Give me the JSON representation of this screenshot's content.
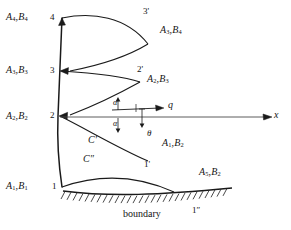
{
  "figure": {
    "title": "boundary",
    "caption": "boundary",
    "axis": {
      "x_label": "x",
      "velocity_label": "q",
      "angle_theta": "θ",
      "angle_alpha_upper": "α",
      "angle_alpha_lower": "α"
    },
    "nodes": [
      {
        "id": "node-4",
        "point_label": "4",
        "riemann_label": "A₄,B₄",
        "A": "A",
        "Asub": "4",
        "B": "B",
        "Bsub": "4"
      },
      {
        "id": "node-3",
        "point_label": "3",
        "riemann_label": "A₃,B₃",
        "A": "A",
        "Asub": "3",
        "B": "B",
        "Bsub": "3"
      },
      {
        "id": "node-2",
        "point_label": "2",
        "riemann_label": "A₂,B₂",
        "A": "A",
        "Asub": "2",
        "B": "B",
        "Bsub": "2"
      },
      {
        "id": "node-1",
        "point_label": "1",
        "riemann_label": "A₁,B₁",
        "A": "A",
        "Asub": "1",
        "B": "B",
        "Bsub": "1"
      }
    ],
    "primed_points": [
      {
        "id": "node-3-prime",
        "label": "3'"
      },
      {
        "id": "node-2-prime",
        "label": "2'"
      },
      {
        "id": "node-1-prime",
        "label": "1'"
      },
      {
        "id": "node-1-double-prime",
        "label": "1″"
      }
    ],
    "field_labels": [
      {
        "id": "label-a3b4",
        "A": "A",
        "Asub": "3",
        "B": "B",
        "Bsub": "4",
        "text": "A₃,B₄"
      },
      {
        "id": "label-a2b3",
        "A": "A",
        "Asub": "2",
        "B": "B",
        "Bsub": "3",
        "text": "A₂,B₃"
      },
      {
        "id": "label-a1b2",
        "A": "A",
        "Asub": "1",
        "B": "B",
        "Bsub": "2",
        "text": "A₁,B₂"
      },
      {
        "id": "label-a5b2",
        "A": "A",
        "Asub": "5",
        "B": "B",
        "Bsub": "2",
        "text": "A₅,B₂"
      }
    ],
    "characteristics": [
      {
        "id": "char-c-prime",
        "label": "C'"
      },
      {
        "id": "char-c-double-prime",
        "label": "C″"
      }
    ],
    "colors": {
      "ink": "#141414",
      "line": "#1a1a1a",
      "background": "#ffffff"
    }
  }
}
